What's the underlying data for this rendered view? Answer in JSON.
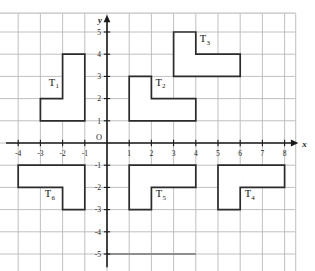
{
  "chart_data": {
    "type": "scatter",
    "title": "",
    "xlabel": "x",
    "ylabel": "y",
    "origin_label": "O",
    "grid": true,
    "xlim": [
      -5,
      8.7
    ],
    "ylim": [
      -5.8,
      6.1
    ],
    "x_ticks": [
      -4,
      -3,
      -2,
      -1,
      1,
      2,
      3,
      4,
      5,
      6,
      7,
      8
    ],
    "x_tick_labels": [
      "-4",
      "-3",
      "-2",
      "-1",
      "1",
      "2",
      "3",
      "4",
      "5",
      "6",
      "7",
      "8"
    ],
    "y_ticks": [
      5,
      4,
      3,
      2,
      1,
      -1,
      -2,
      -3,
      -4,
      -5
    ],
    "y_tick_labels": [
      "5",
      "4",
      "3",
      "2",
      "1",
      "-1",
      "-2",
      "-3",
      "-4",
      "-5"
    ],
    "shapes": [
      {
        "name": "T1",
        "label": "T",
        "subscript": "1",
        "label_x": -2.62,
        "label_y": 2.58,
        "points": [
          [
            -3,
            1
          ],
          [
            -1,
            1
          ],
          [
            -1,
            4
          ],
          [
            -2,
            4
          ],
          [
            -2,
            2
          ],
          [
            -3,
            2
          ]
        ]
      },
      {
        "name": "T2",
        "label": "T",
        "subscript": "2",
        "label_x": 2.18,
        "label_y": 2.58,
        "points": [
          [
            1,
            1
          ],
          [
            4,
            1
          ],
          [
            4,
            2
          ],
          [
            2,
            2
          ],
          [
            2,
            3
          ],
          [
            1,
            3
          ]
        ]
      },
      {
        "name": "T3",
        "label": "T",
        "subscript": "3",
        "label_x": 4.18,
        "label_y": 4.55,
        "points": [
          [
            3,
            3
          ],
          [
            6,
            3
          ],
          [
            6,
            4
          ],
          [
            4,
            4
          ],
          [
            4,
            5
          ],
          [
            3,
            5
          ]
        ]
      },
      {
        "name": "T4",
        "label": "T",
        "subscript": "4",
        "label_x": 6.2,
        "label_y": -2.45,
        "points": [
          [
            5,
            -1
          ],
          [
            8,
            -1
          ],
          [
            8,
            -2
          ],
          [
            6,
            -2
          ],
          [
            6,
            -3
          ],
          [
            5,
            -3
          ]
        ]
      },
      {
        "name": "T5",
        "label": "T",
        "subscript": "5",
        "label_x": 2.2,
        "label_y": -2.45,
        "points": [
          [
            1,
            -1
          ],
          [
            4,
            -1
          ],
          [
            4,
            -2
          ],
          [
            2,
            -2
          ],
          [
            2,
            -3
          ],
          [
            1,
            -3
          ]
        ]
      },
      {
        "name": "T6",
        "label": "T",
        "subscript": "6",
        "label_x": -2.8,
        "label_y": -2.45,
        "points": [
          [
            -4,
            -1
          ],
          [
            -1,
            -1
          ],
          [
            -1,
            -3
          ],
          [
            -2,
            -3
          ],
          [
            -2,
            -2
          ],
          [
            -4,
            -2
          ]
        ]
      }
    ],
    "accent_segment": {
      "x1": 0,
      "y1": -5,
      "x2": 4,
      "y2": -5
    }
  }
}
